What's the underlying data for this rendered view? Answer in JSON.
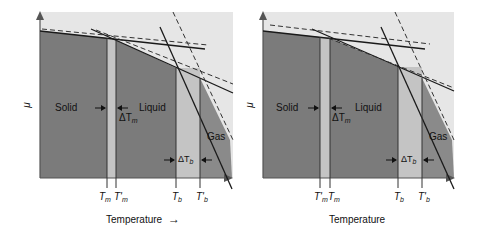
{
  "colors": {
    "background": "#ffffff",
    "plot_bg": "#e6e6e6",
    "solid_liquid_region": "#7b7b7b",
    "gap_band": "#c4c4c4",
    "gas_region": "#8a8a8a",
    "line": "#1a1a1a"
  },
  "panels": [
    {
      "id": "left",
      "y_axis_label": "μ",
      "labels": {
        "solid": "Solid",
        "liquid": "Liquid",
        "gas": "Gas",
        "delta_tm": "ΔT",
        "delta_tm_sub": "m",
        "delta_tb": "ΔT",
        "delta_tb_sub": "b"
      },
      "ticks": [
        {
          "main": "T",
          "sub": "m",
          "prime": ""
        },
        {
          "main": "T",
          "sub": "m",
          "prime": "'"
        },
        {
          "main": "T",
          "sub": "b",
          "prime": ""
        },
        {
          "main": "T",
          "sub": "b",
          "prime": "'"
        }
      ],
      "x_axis_label": "Temperature",
      "x_axis_arrow": "→"
    },
    {
      "id": "right",
      "y_axis_label": "μ",
      "labels": {
        "solid": "Solid",
        "liquid": "Liquid",
        "gas": "Gas",
        "delta_tm": "ΔT",
        "delta_tm_sub": "m",
        "delta_tb": "ΔT",
        "delta_tb_sub": "b"
      },
      "ticks": [
        {
          "main": "T",
          "sub": "m",
          "prime": "'"
        },
        {
          "main": "T",
          "sub": "m",
          "prime": ""
        },
        {
          "main": "T",
          "sub": "b",
          "prime": ""
        },
        {
          "main": "T",
          "sub": "b",
          "prime": "'"
        }
      ],
      "x_axis_label": "Temperature",
      "x_axis_arrow": ""
    }
  ]
}
